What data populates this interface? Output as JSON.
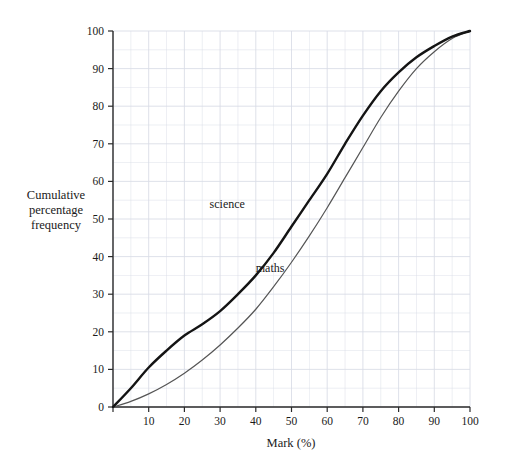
{
  "chart_data": {
    "type": "line",
    "title": "",
    "subtitle": "",
    "xlabel": "Mark (%)",
    "ylabel": "Cumulative percentage frequency",
    "ylabel_lines": [
      "Cumulative",
      "percentage",
      "frequency"
    ],
    "xlim": [
      0,
      100
    ],
    "ylim": [
      0,
      100
    ],
    "xticks": [
      0,
      10,
      20,
      30,
      40,
      50,
      60,
      70,
      80,
      90,
      100
    ],
    "xtick_labels": [
      "0",
      "10",
      "20",
      "30",
      "40",
      "50",
      "60",
      "70",
      "80",
      "90",
      "100"
    ],
    "yticks": [
      0,
      10,
      20,
      30,
      40,
      50,
      60,
      70,
      80,
      90,
      100
    ],
    "ytick_labels": [
      "0",
      "10",
      "20",
      "30",
      "40",
      "50",
      "60",
      "70",
      "80",
      "90",
      "100"
    ],
    "grid": true,
    "grid_minor_step": 5,
    "grid_color": "#d9dde6",
    "legend": "inline-annotations",
    "annotations": [
      {
        "text": "science",
        "x": 32,
        "y": 53
      },
      {
        "text": "maths",
        "x": 44,
        "y": 36
      }
    ],
    "x": [
      0,
      5,
      10,
      15,
      20,
      25,
      30,
      35,
      40,
      45,
      50,
      55,
      60,
      65,
      70,
      75,
      80,
      85,
      90,
      95,
      100
    ],
    "series": [
      {
        "name": "science",
        "style": "thick-black",
        "color": "#141414",
        "width": 2.4,
        "values": [
          0,
          5,
          10.5,
          15,
          19,
          22,
          25.5,
          30,
          35,
          41,
          48,
          55,
          62,
          70,
          77.5,
          84,
          89,
          93,
          96,
          98.5,
          100
        ]
      },
      {
        "name": "maths",
        "style": "thin-grey",
        "color": "#555555",
        "width": 1.2,
        "values": [
          0,
          1.5,
          3.5,
          6,
          9,
          12.5,
          16.5,
          21,
          26,
          32,
          38.5,
          45.5,
          53,
          61,
          69,
          77,
          84,
          90,
          94.5,
          98,
          100
        ]
      }
    ]
  },
  "page": {
    "background": "#ffffff",
    "text_color": "#1a1a1a"
  }
}
